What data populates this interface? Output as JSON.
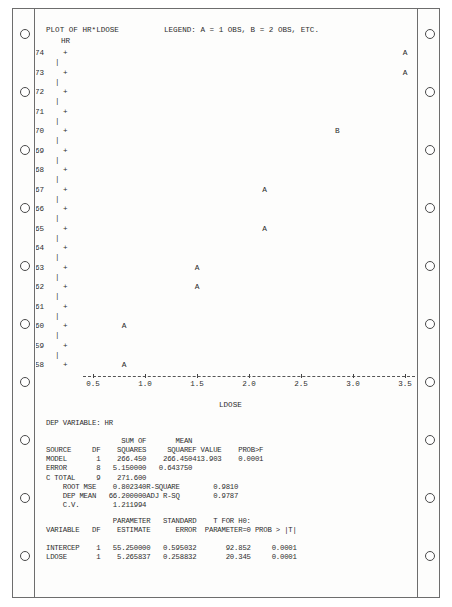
{
  "document": {
    "kind": "sas-printout",
    "paper": "continuous-feed",
    "sprocket_holes_per_side": 10
  },
  "plot": {
    "title": "PLOT OF HR*LDOSE",
    "legend": "LEGEND: A = 1 OBS, B = 2 OBS, ETC.",
    "y_axis_name": "HR",
    "x_axis_name": "LDOSE"
  },
  "chart_data": {
    "type": "scatter",
    "title": "PLOT OF HR*LDOSE",
    "subtitle": "LEGEND: A = 1 OBS, B = 2 OBS, ETC.",
    "xlabel": "LDOSE",
    "ylabel": "HR",
    "xlim": [
      0.5,
      3.5
    ],
    "ylim": [
      58,
      74
    ],
    "xticks": [
      "0.5",
      "1.0",
      "1.5",
      "2.0",
      "2.5",
      "3.0",
      "3.5"
    ],
    "xtick_values": [
      0.5,
      1.0,
      1.5,
      2.0,
      2.5,
      3.0,
      3.5
    ],
    "yticks": [
      "74",
      "73",
      "72",
      "71",
      "70",
      "69",
      "68",
      "67",
      "66",
      "65",
      "64",
      "63",
      "62",
      "61",
      "60",
      "59",
      "58"
    ],
    "ytick_values": [
      74,
      73,
      72,
      71,
      70,
      69,
      68,
      67,
      66,
      65,
      64,
      63,
      62,
      61,
      60,
      59,
      58
    ],
    "grid": false,
    "legend_position": "top",
    "point_symbols": {
      "A": "1 observation",
      "B": "2 observations"
    },
    "points": [
      {
        "x": 3.5,
        "y": 74,
        "label": "A",
        "count": 1
      },
      {
        "x": 3.5,
        "y": 73,
        "label": "A",
        "count": 1
      },
      {
        "x": 2.85,
        "y": 70,
        "label": "B",
        "count": 2
      },
      {
        "x": 2.15,
        "y": 67,
        "label": "A",
        "count": 1
      },
      {
        "x": 2.15,
        "y": 65,
        "label": "A",
        "count": 1
      },
      {
        "x": 1.5,
        "y": 63,
        "label": "A",
        "count": 1
      },
      {
        "x": 1.5,
        "y": 62,
        "label": "A",
        "count": 1
      },
      {
        "x": 0.8,
        "y": 60,
        "label": "A",
        "count": 1
      },
      {
        "x": 0.8,
        "y": 58,
        "label": "A",
        "count": 1
      }
    ]
  },
  "anova": {
    "dep_variable_label": "DEP VARIABLE: HR",
    "header_top": [
      "",
      "",
      "SUM OF",
      "MEAN",
      "",
      ""
    ],
    "headers": [
      "SOURCE",
      "DF",
      "SQUARES",
      "SQUARE",
      "F VALUE",
      "PROB>F"
    ],
    "rows": [
      [
        "MODEL",
        "1",
        "266.450",
        "266.450",
        "413.903",
        "0.0001"
      ],
      [
        "ERROR",
        "8",
        "5.150000",
        "0.643750",
        "",
        ""
      ],
      [
        "C TOTAL",
        "9",
        "271.600",
        "",
        "",
        ""
      ]
    ],
    "stats": [
      [
        "ROOT MSE",
        "0.802340",
        "R-SQUARE",
        "0.9810"
      ],
      [
        "DEP MEAN",
        "66.200000",
        "ADJ R-SQ",
        "0.9787"
      ],
      [
        "C.V.",
        "1.211994",
        "",
        ""
      ]
    ]
  },
  "parameters": {
    "header_top": [
      "",
      "",
      "PARAMETER",
      "STANDARD",
      "T FOR H0:",
      ""
    ],
    "headers": [
      "VARIABLE",
      "DF",
      "ESTIMATE",
      "ERROR",
      "PARAMETER=0",
      "PROB > |T|"
    ],
    "rows": [
      [
        "INTERCEP",
        "1",
        "55.250000",
        "0.595032",
        "92.852",
        "0.0001"
      ],
      [
        "LDOSE",
        "1",
        "5.265837",
        "0.258832",
        "20.345",
        "0.0001"
      ]
    ]
  }
}
